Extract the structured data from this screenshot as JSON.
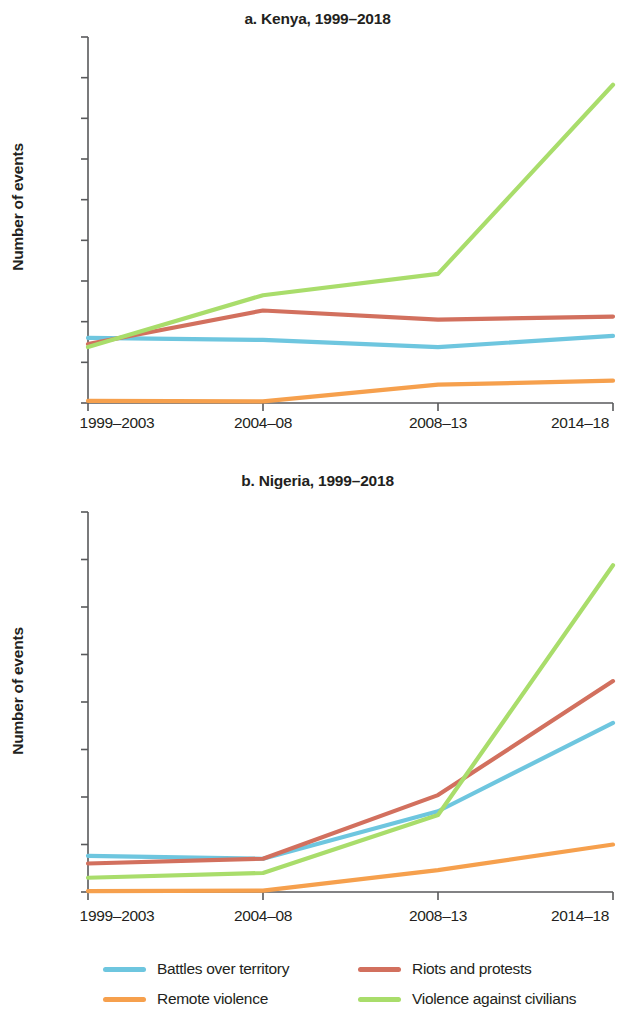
{
  "legend": {
    "items": [
      {
        "label": "Battles over territory",
        "key": "battles",
        "color": "#6EC6DF"
      },
      {
        "label": "Riots and protests",
        "key": "riots",
        "color": "#D2705E"
      },
      {
        "label": "Remote violence",
        "key": "remote",
        "color": "#F6A04D"
      },
      {
        "label": "Violence against civilians",
        "key": "civilians",
        "color": "#A9DD6B"
      }
    ]
  },
  "chart_data": [
    {
      "type": "line",
      "panel": "a",
      "title": "a. Kenya, 1999–2018",
      "xlabel": "",
      "ylabel": "Number of events",
      "categories": [
        "1999–2003",
        "2004–08",
        "2008–13",
        "2014–18"
      ],
      "ylim": [
        0,
        1800
      ],
      "yticks": [
        0,
        200,
        400,
        600,
        800,
        1000,
        1200,
        1400,
        1600,
        1800
      ],
      "ytick_labels": [
        "0",
        "200",
        "400",
        "600",
        "800",
        "1,000",
        "1,200",
        "1,400",
        "1,600",
        "1,800"
      ],
      "grid": false,
      "legend_position": "bottom",
      "series": [
        {
          "name": "Battles over territory",
          "color": "#6EC6DF",
          "values": [
            320,
            310,
            275,
            330
          ]
        },
        {
          "name": "Riots and protests",
          "color": "#D2705E",
          "values": [
            290,
            455,
            410,
            425
          ]
        },
        {
          "name": "Remote violence",
          "color": "#F6A04D",
          "values": [
            10,
            8,
            90,
            110
          ]
        },
        {
          "name": "Violence against civilians",
          "color": "#A9DD6B",
          "values": [
            275,
            530,
            635,
            1565
          ]
        }
      ]
    },
    {
      "type": "line",
      "panel": "b",
      "title": "b. Nigeria, 1999–2018",
      "xlabel": "",
      "ylabel": "Number of events",
      "categories": [
        "1999–2003",
        "2004–08",
        "2008–13",
        "2014–18"
      ],
      "ylim": [
        0,
        4000
      ],
      "yticks": [
        0,
        500,
        1000,
        1500,
        2000,
        2500,
        3000,
        3500,
        4000
      ],
      "ytick_labels": [
        "0",
        "500",
        "1,000",
        "1,500",
        "2,000",
        "2,500",
        "3,000",
        "3,500",
        "4,000"
      ],
      "grid": false,
      "legend_position": "bottom",
      "series": [
        {
          "name": "Battles over territory",
          "color": "#6EC6DF",
          "values": [
            380,
            350,
            850,
            1780
          ]
        },
        {
          "name": "Riots and protests",
          "color": "#D2705E",
          "values": [
            300,
            350,
            1020,
            2220
          ]
        },
        {
          "name": "Remote violence",
          "color": "#F6A04D",
          "values": [
            10,
            15,
            230,
            500
          ]
        },
        {
          "name": "Violence against civilians",
          "color": "#A9DD6B",
          "values": [
            150,
            200,
            810,
            3440
          ]
        }
      ]
    }
  ]
}
